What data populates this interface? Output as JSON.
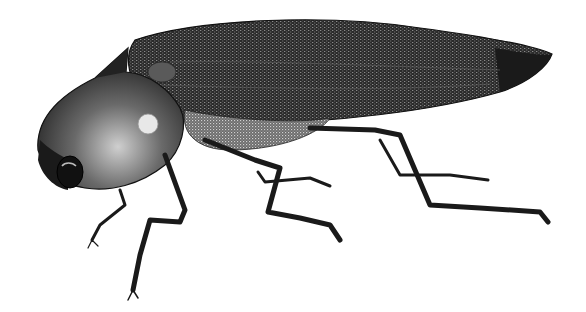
{
  "image": {
    "subject": "beetle illustration",
    "style": "black-and-white engraving",
    "colors": {
      "background": "#ffffff",
      "ink": "#1a1a1a",
      "mid": "#3a3a3a",
      "light": "#9a9a9a"
    }
  }
}
